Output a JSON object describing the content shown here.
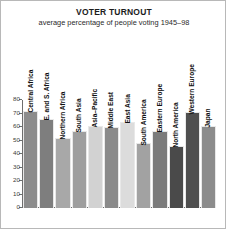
{
  "chart_data": {
    "type": "bar",
    "title": "VOTER TURNOUT",
    "subtitle": "average percentage of people voting 1945–98",
    "xlabel": "",
    "ylabel": "",
    "ylim": [
      0,
      80
    ],
    "yticks": [
      0,
      10,
      20,
      30,
      40,
      50,
      60,
      70,
      80
    ],
    "grid": false,
    "legend": "none",
    "categories": [
      "Central Africa",
      "E. and S. Africa",
      "Northern Africa",
      "South Asia",
      "Asia–Pacific",
      "Middle East",
      "East Asia",
      "South America",
      "Eastern Europe",
      "North America",
      "Western Europe",
      "Japan"
    ],
    "values": [
      72,
      66,
      52,
      57,
      61,
      60,
      64,
      48,
      57,
      46,
      71,
      61
    ],
    "bar_colors": [
      "#8c8c8c",
      "#7e7e7e",
      "#a8a8a8",
      "#9e9e9e",
      "#d2d2d2",
      "#8a8a8a",
      "#dcdcdc",
      "#a2a2a2",
      "#7b7b7b",
      "#4a4a4a",
      "#4f4f4f",
      "#8c8c8c"
    ]
  },
  "colors": {
    "axis": "#6e6e6e",
    "text": "#1c1c1c",
    "background": "#ffffff",
    "frame_border": "#b8b8b8"
  }
}
